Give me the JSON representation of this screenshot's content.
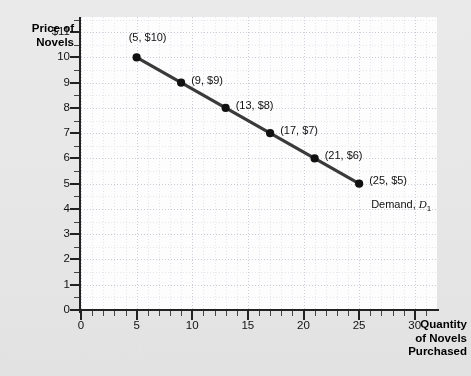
{
  "figure": {
    "watermark": "Illustrated"
  },
  "chart_data": {
    "type": "line",
    "title": "",
    "xlabel": "Quantity of Novels Purchased",
    "ylabel": "Price of Novels",
    "xlabel_lines": [
      "Quantity",
      "of Novels",
      "Purchased"
    ],
    "ylabel_lines": [
      "Price of",
      "Novels"
    ],
    "grid": true,
    "legend_position": "inline-annotation",
    "xlim": [
      0,
      32
    ],
    "ylim": [
      0,
      11.6
    ],
    "xticks": [
      0,
      5,
      10,
      15,
      20,
      25,
      30
    ],
    "xtick_labels": [
      "0",
      "5",
      "10",
      "15",
      "20",
      "25",
      "30"
    ],
    "xtick_minor_step": 1,
    "yticks": [
      0,
      1,
      2,
      3,
      4,
      5,
      6,
      7,
      8,
      9,
      10,
      11
    ],
    "ytick_labels": [
      "0",
      "1",
      "2",
      "3",
      "4",
      "5",
      "6",
      "7",
      "8",
      "9",
      "10",
      "$11"
    ],
    "ytick_minor_step": 0.5,
    "series": [
      {
        "name": "Demand, D1",
        "annotation": "Demand,",
        "annotation_symbol": "D",
        "annotation_subscript": "1",
        "color": "#3a3a3a",
        "x": [
          5,
          9,
          13,
          17,
          21,
          25
        ],
        "y": [
          10,
          9,
          8,
          7,
          6,
          5
        ],
        "point_labels": [
          "(5, $10)",
          "(9, $9)",
          "(13, $8)",
          "(17, $7)",
          "(21, $6)",
          "(25, $5)"
        ]
      }
    ]
  },
  "colors": {
    "curve": "#3a3a3a",
    "axis": "#222222",
    "grid_major": "#c7ccd6",
    "grid_minor": "#e3e6ec",
    "plot_background": "#fdfdfd",
    "figure_background": "#e8e8e8"
  }
}
